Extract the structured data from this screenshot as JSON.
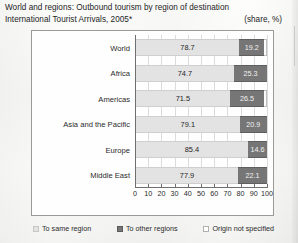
{
  "title": {
    "line1": "World and regions: Outbound tourism by region of destination",
    "line2": "International Tourist Arrivals, 2005*",
    "units": "(share, %)"
  },
  "chart_data": {
    "type": "bar",
    "orientation": "horizontal",
    "stacked": true,
    "xlabel": "",
    "ylabel": "",
    "xlim": [
      0,
      100
    ],
    "xticks": [
      0,
      10,
      20,
      30,
      40,
      50,
      60,
      70,
      80,
      90,
      100
    ],
    "grid": true,
    "legend_position": "bottom",
    "units": "share, %",
    "categories": [
      "World",
      "Africa",
      "Americas",
      "Asia and the Pacific",
      "Europe",
      "Middle East"
    ],
    "series": [
      {
        "name": "To same region",
        "color": "#e3e3e3",
        "values": [
          78.7,
          74.7,
          71.5,
          79.1,
          85.4,
          77.9
        ],
        "labels": [
          "78.7",
          "74.7",
          "71.5",
          "79.1",
          "85.4",
          "77.9"
        ]
      },
      {
        "name": "To other regions",
        "color": "#767676",
        "values": [
          19.2,
          25.3,
          26.5,
          20.9,
          14.6,
          22.1
        ],
        "labels": [
          "19.2",
          "25.3",
          "26.5",
          "20.9",
          "14.6",
          "22.1"
        ]
      },
      {
        "name": "Origin not specified",
        "color": "#ffffff",
        "values": [
          2.1,
          0.0,
          2.0,
          0.0,
          0.0,
          0.0
        ],
        "labels": [
          "",
          "",
          "",
          "",
          "",
          ""
        ]
      }
    ]
  },
  "legend": [
    {
      "label": "To same region",
      "swatch": "swatch-light-gray"
    },
    {
      "label": "To other regions",
      "swatch": "swatch-dark-gray"
    },
    {
      "label": "Origin not specified",
      "swatch": "swatch-white"
    }
  ]
}
